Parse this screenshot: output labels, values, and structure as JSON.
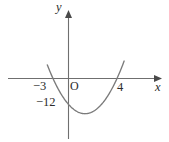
{
  "figure": {
    "kind": "coordinate-plane-parabola-sketch",
    "background_color": "#ffffff",
    "curve_color": "#7b7b7b",
    "axis_color": "#6f6f6f",
    "text_color": "#2b2b2b"
  },
  "axes": {
    "x_axis_name": "x",
    "y_axis_name": "y",
    "origin_label": "O"
  },
  "labels": {
    "root_left": "−3",
    "root_right": "4",
    "y_intercept": "−12"
  },
  "chart_data": {
    "type": "line",
    "title": "",
    "subtitle": "",
    "xlabel": "x",
    "ylabel": "y",
    "grid": false,
    "legend": "none",
    "annotations": [
      "−3",
      "O",
      "4",
      "−12"
    ],
    "curves": [
      {
        "name": "parabola",
        "equation": "y = x^2 - x - 12",
        "a": 1,
        "b": -1,
        "c": -12,
        "roots": [
          -3,
          4
        ],
        "y_intercept": -12,
        "vertex": [
          0.5,
          -12.25
        ],
        "opens": "up",
        "x": [
          -3.6,
          -3.2,
          -3,
          -2.5,
          -2,
          -1.5,
          -1,
          -0.5,
          0,
          0.5,
          1,
          1.5,
          2,
          2.5,
          3,
          3.5,
          4,
          4.4,
          4.8
        ],
        "y": [
          4.56,
          1.44,
          0,
          -3.25,
          -6,
          -8.25,
          -10,
          -11.25,
          -12,
          -12.25,
          -12,
          -11.25,
          -10,
          -8.25,
          -6,
          -3.25,
          0,
          2.96,
          6.24
        ]
      }
    ],
    "xlim": [
      -4.4,
      6.1
    ],
    "ylim": [
      -17.5,
      9.5
    ],
    "x_ticks": [
      -3,
      4
    ],
    "y_ticks": [
      -12
    ],
    "x_tick_labels": [
      "−3",
      "4"
    ],
    "y_tick_labels": [
      "−12"
    ]
  }
}
